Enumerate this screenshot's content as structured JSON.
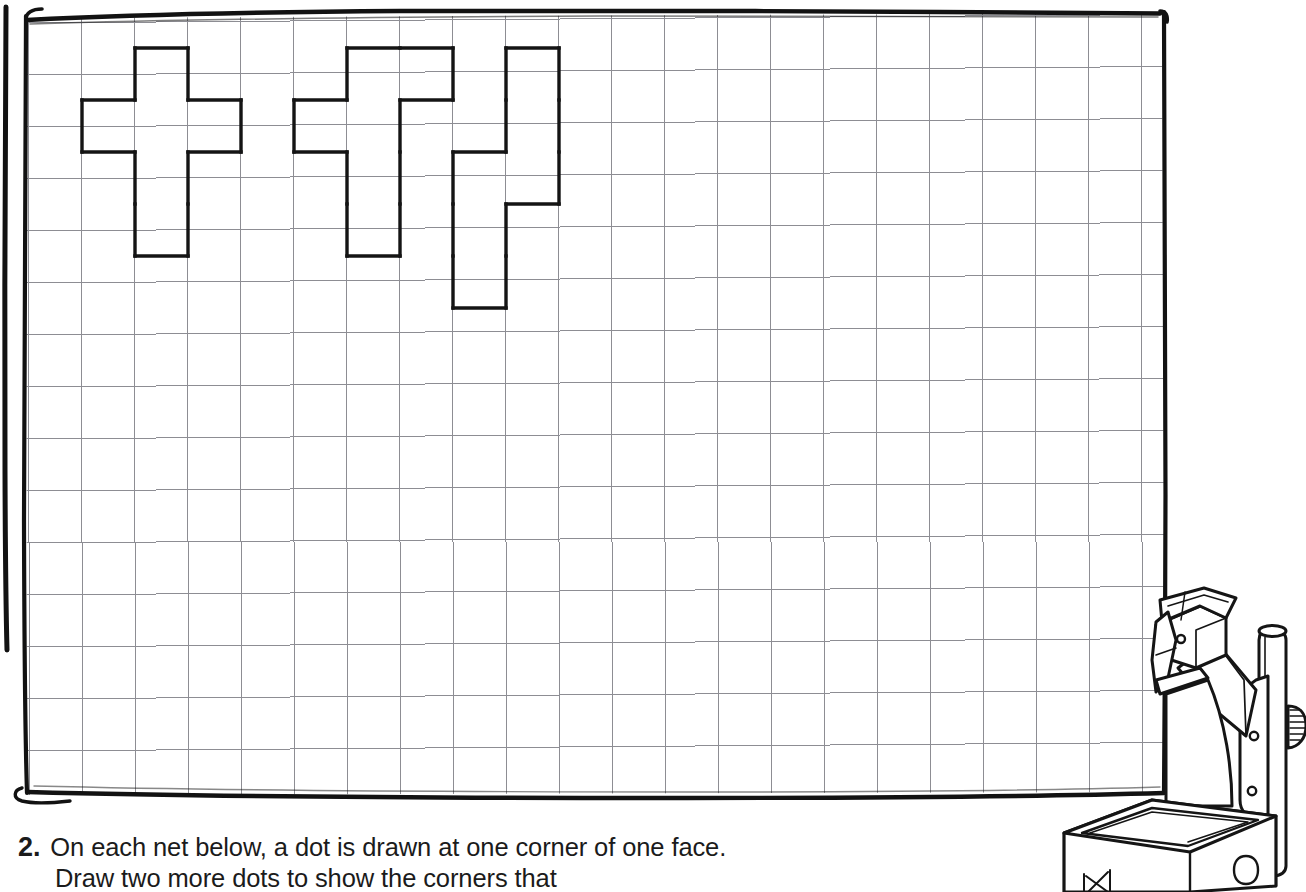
{
  "page": {
    "background_color": "#ffffff",
    "ink_color": "#1b1b1b"
  },
  "whiteboard": {
    "name": "whiteboard-with-square-grid",
    "frame_color": "#121212",
    "grid_line_color": "#8d8d93",
    "grid": {
      "origin_x": 28,
      "origin_y": 23,
      "cell_width": 53,
      "cell_height": 52,
      "columns": 21,
      "rows": 15,
      "right_edge_x": 1163,
      "bottom_edge_y": 795
    },
    "outer_frame_line": {
      "x": 5,
      "y_top": 6,
      "y_bottom": 648
    }
  },
  "nets": [
    {
      "label": "net-1",
      "shape_name": "cross-net",
      "cells": [
        {
          "col": 2,
          "row": 0
        },
        {
          "col": 1,
          "row": 1
        },
        {
          "col": 2,
          "row": 1
        },
        {
          "col": 3,
          "row": 1
        },
        {
          "col": 2,
          "row": 2
        },
        {
          "col": 2,
          "row": 3
        }
      ]
    },
    {
      "label": "net-2",
      "shape_name": "stepped-net",
      "cells": [
        {
          "col": 6,
          "row": 0
        },
        {
          "col": 7,
          "row": 0
        },
        {
          "col": 5,
          "row": 1
        },
        {
          "col": 6,
          "row": 1
        },
        {
          "col": 6,
          "row": 2
        },
        {
          "col": 6,
          "row": 3
        }
      ]
    },
    {
      "label": "net-3",
      "shape_name": "zigzag-net",
      "cells": [
        {
          "col": 9,
          "row": 0
        },
        {
          "col": 9,
          "row": 1
        },
        {
          "col": 8,
          "row": 2
        },
        {
          "col": 9,
          "row": 2
        },
        {
          "col": 8,
          "row": 3
        },
        {
          "col": 8,
          "row": 4
        }
      ]
    }
  ],
  "question": {
    "number": "2.",
    "line1": "On each net below, a dot is drawn at one corner of one face.",
    "line2": "Draw two more dots to show the corners that"
  },
  "illustration": {
    "name": "overhead-projector",
    "caption_none": true
  }
}
